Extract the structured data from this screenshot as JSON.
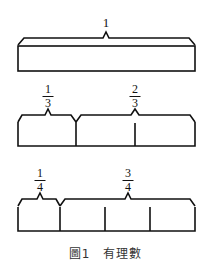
{
  "figure": {
    "caption": "圖1　有理數",
    "bars": [
      {
        "label": "1",
        "divisions": 1
      },
      {
        "labels": [
          {
            "num": "1",
            "den": "3"
          },
          {
            "num": "2",
            "den": "3"
          }
        ],
        "divisions": 3
      },
      {
        "labels": [
          {
            "num": "1",
            "den": "4"
          },
          {
            "num": "3",
            "den": "4"
          }
        ],
        "divisions": 4
      }
    ]
  }
}
